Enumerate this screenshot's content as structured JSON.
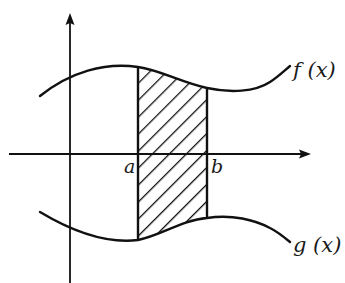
{
  "diagram": {
    "labels": {
      "f": "f (x)",
      "g": "g (x)",
      "a": "a",
      "b": "b"
    },
    "colors": {
      "stroke": "#111111",
      "background": "#ffffff",
      "hatch": "#111111"
    },
    "axes": {
      "x_axis": "horizontal axis with arrow",
      "y_axis": "vertical axis with arrow"
    },
    "region": {
      "description": "hatched region between f(x) above and g(x) below, from x = a to x = b",
      "hatch_style": "diagonal 45°"
    }
  }
}
